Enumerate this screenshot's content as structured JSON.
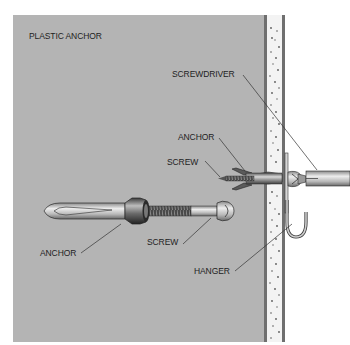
{
  "diagram": {
    "title": "PLASTIC ANCHOR",
    "labels": {
      "screwdriver": "SCREWDRIVER",
      "anchor_installed": "ANCHOR",
      "screw_installed": "SCREW",
      "anchor_exploded": "ANCHOR",
      "screw_exploded": "SCREW",
      "hanger": "HANGER"
    },
    "colors": {
      "background_panel": "#b4b4b4",
      "drywall": "#f2f2f2",
      "wall_edge": "#7a7a7a",
      "outline": "#2a2a2a",
      "leader_line": "#333333"
    }
  }
}
